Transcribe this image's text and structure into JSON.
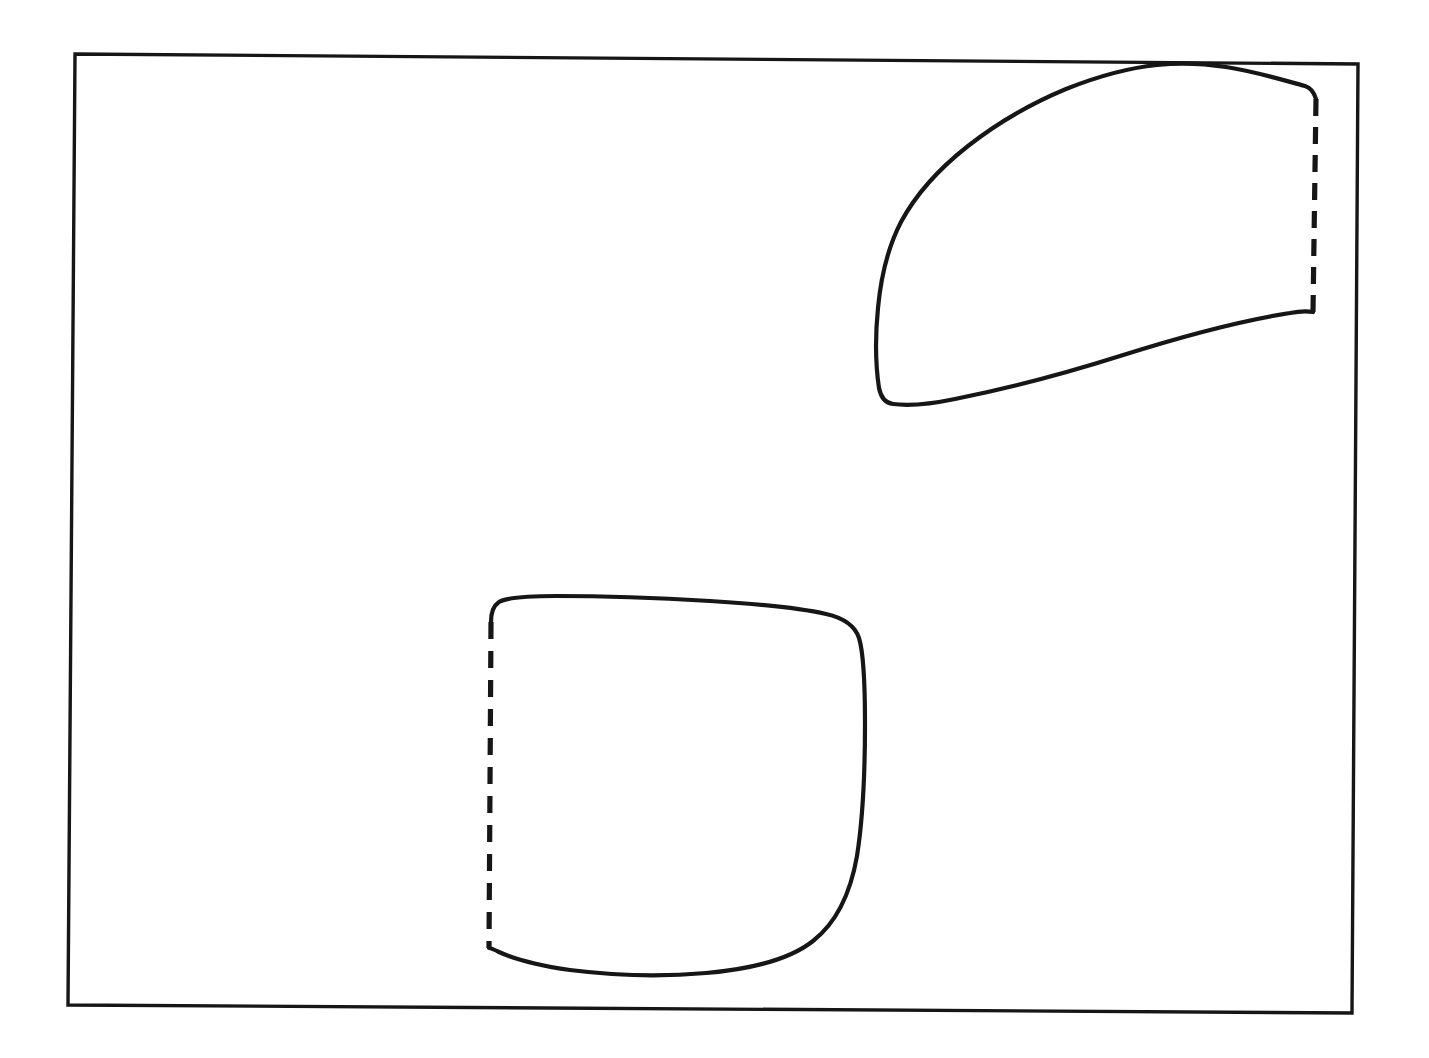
{
  "figure": {
    "kind": "hand-drawn-diagram",
    "title": "",
    "background_color": "#ffffff",
    "ink_color": "#161616",
    "canvas": {
      "width": 1429,
      "height": 1058
    },
    "frame": {
      "name": "outer-rectangle",
      "style": "solid",
      "stroke_width": 3.4,
      "corners": {
        "top_left": [
          75,
          54
        ],
        "top_right": [
          1358,
          64
        ],
        "bottom_right": [
          1352,
          1013
        ],
        "bottom_left": [
          68,
          1005
        ]
      },
      "path": "M 75,54 L 1358,64 L 1352,1013 L 68,1005 Z"
    },
    "regions": [
      {
        "name": "upper-right-region",
        "label": "",
        "position": "upper-right",
        "solid_stroke_width": 4.2,
        "dashed_stroke_width": 5.2,
        "dash_pattern": "17 11",
        "dashed_edge": {
          "description": "vertical dashed segment on the right side, flush near the frame right edge",
          "from": [
            1316,
            99
          ],
          "to": [
            1313,
            312
          ]
        },
        "extent": {
          "left": 877,
          "right": 1318,
          "top": 64,
          "bottom": 405
        },
        "touches_frame": [
          "top"
        ],
        "solid_path": "M 1316,99 C 1314,92 1311,88 1305,86 C 1286,81 1258,72 1226,67 C 1200,63 1175,63 1157,65 C 1128,68 1096,77 1066,89 C 1030,104 996,124 968,146 C 940,168 916,194 901,222 C 888,247 881,276 878,308 C 875,338 876,368 879,388 C 881,398 885,403 893,404 C 909,406 931,404 955,399 C 1000,390 1060,375 1120,356 C 1180,337 1245,320 1290,313 C 1300,311 1308,311 1313,312",
        "dashed_path": "M 1316,99 L 1313,312"
      },
      {
        "name": "lower-left-region",
        "label": "",
        "position": "lower-center-left",
        "solid_stroke_width": 4.2,
        "dashed_stroke_width": 5.2,
        "dash_pattern": "17 12",
        "dashed_edge": {
          "description": "vertical dashed segment on the left side",
          "from": [
            491,
            620
          ],
          "to": [
            489,
            948
          ]
        },
        "extent": {
          "left": 489,
          "right": 864,
          "top": 598,
          "bottom": 975
        },
        "touches_frame": [],
        "solid_path": "M 491,622 C 491,613 493,606 499,602 C 508,597 528,596 556,596 C 600,596 660,598 710,601 C 760,604 800,608 826,614 C 844,618 855,626 859,638 C 864,654 865,686 865,724 C 865,772 863,818 857,856 C 850,896 836,923 813,941 C 789,960 752,969 706,973 C 660,977 610,975 570,970 C 536,965 512,958 499,952 C 493,949 490,948 489,948",
        "dashed_path": "M 491,622 L 489,948"
      }
    ]
  }
}
